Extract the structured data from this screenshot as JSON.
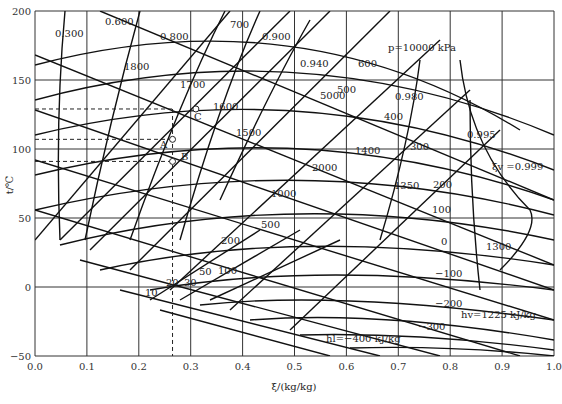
{
  "chart_data": {
    "type": "line",
    "title": "",
    "xlabel": "ξ/(kg/kg)",
    "ylabel": "t/℃",
    "xlim": [
      0.0,
      1.0
    ],
    "ylim": [
      -50,
      200
    ],
    "xticks": [
      "0.0",
      "0.1",
      "0.2",
      "0.3",
      "0.4",
      "0.5",
      "0.6",
      "0.7",
      "0.8",
      "0.9",
      "1.0"
    ],
    "yticks": [
      "-50",
      "0",
      "50",
      "100",
      "150",
      "200"
    ],
    "grid": true,
    "legend": "none",
    "series_families": {
      "vapor_quality_xi_v": [
        "0.300",
        "0.600",
        "0.800",
        "0.900",
        "0.940",
        "0.980",
        "0.995",
        "0.999"
      ],
      "pressure_kPa": [
        "10",
        "20",
        "30",
        "50",
        "100",
        "200",
        "500",
        "1000",
        "2000",
        "5000",
        "10000"
      ],
      "liquid_enthalpy_h_l_kJ_per_kg": [
        "-400",
        "-300",
        "-200",
        "-100",
        "0",
        "100",
        "200",
        "300",
        "400",
        "500",
        "600",
        "700"
      ],
      "vapor_enthalpy_h_v_kJ_per_kg": [
        "1225",
        "1300",
        "1350",
        "1400",
        "1500",
        "1600",
        "1700",
        "1800"
      ]
    },
    "annotations": {
      "p_label": "p=10000 kPa",
      "xi_label": "ξv=0.999",
      "hv_label": "hv=1225 kJ/kg",
      "hl_label": "hl=−400 kJ/kg",
      "points": [
        {
          "name": "A",
          "xi": 0.265,
          "t": 107
        },
        {
          "name": "B",
          "xi": 0.265,
          "t": 91
        },
        {
          "name": "C",
          "xi": 0.31,
          "t": 129
        }
      ],
      "dashed_guides": {
        "xi": 0.265,
        "t": [
          129,
          107,
          91
        ]
      }
    }
  },
  "labels": {
    "q300": "0.300",
    "q600": "0.600",
    "q800": "0.800",
    "q900": "0.900",
    "q940": "0.940",
    "q980": "0.980",
    "q995": "0.995",
    "q999": "ξv =0.999",
    "p10000": "p=10000 kPa",
    "p5000": "5000",
    "p2000": "2000",
    "p1000": "1000",
    "p500": "500",
    "p200": "200",
    "p100": "100",
    "p50": "50",
    "p30": "30",
    "p20": "20",
    "p10": "10",
    "hl700": "700",
    "hl600": "600",
    "hl500": "500",
    "hl400": "400",
    "hl300": "300",
    "hl200": "200",
    "hl100": "100",
    "hl0": "0",
    "hlm100": "−100",
    "hlm200": "−200",
    "hlm300": "−300",
    "hlm400": "hl=−400 kJ/kg",
    "hv1800": "1800",
    "hv1700": "1700",
    "hv1600": "1600",
    "hv1500": "1500",
    "hv1400": "1400",
    "hv1350": "1350",
    "hv1300": "1300",
    "hv1225": "hv=1225 kJ/kg",
    "A": "A",
    "B": "B",
    "C": "C"
  }
}
